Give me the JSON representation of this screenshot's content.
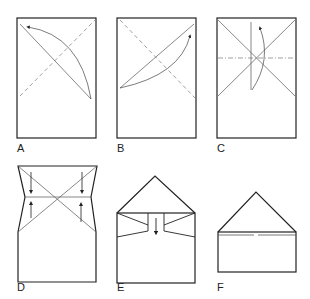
{
  "figure": {
    "panels": [
      {
        "id": "A",
        "label": "A",
        "label_pos": [
          17,
          142
        ]
      },
      {
        "id": "B",
        "label": "B",
        "label_pos": [
          117,
          142
        ]
      },
      {
        "id": "C",
        "label": "C",
        "label_pos": [
          217,
          142
        ]
      },
      {
        "id": "D",
        "label": "D",
        "label_pos": [
          17,
          281
        ]
      },
      {
        "id": "E",
        "label": "E",
        "label_pos": [
          117,
          281
        ]
      },
      {
        "id": "F",
        "label": "F",
        "label_pos": [
          217,
          281
        ]
      }
    ],
    "colors": {
      "stroke": "#222222",
      "fold_line": "#888888",
      "background": "#ffffff"
    }
  }
}
